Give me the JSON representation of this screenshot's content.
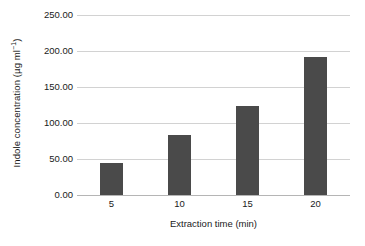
{
  "chart_data": {
    "type": "bar",
    "title": "",
    "categories": [
      "5",
      "10",
      "15",
      "20"
    ],
    "values": [
      44,
      83,
      123,
      191
    ],
    "series": [
      {
        "name": "Indole concentration",
        "values": [
          44,
          83,
          123,
          191
        ]
      }
    ],
    "xlabel": "Extraction time (min)",
    "ylabel_text": "Indole concentration (µg ml",
    "ylabel_sup": "−1",
    "ylabel_tail": ")",
    "ylabel_full": "Indole concentration (µg ml⁻¹)",
    "ylim": [
      0,
      250
    ],
    "xlim_categories": 4,
    "ytick_labels": [
      "250.00",
      "200.00",
      "150.00",
      "100.00",
      "50.00",
      "0.00"
    ],
    "ytick_values": [
      250,
      200,
      150,
      100,
      50,
      0
    ],
    "xtick_labels": [
      "5",
      "10",
      "15",
      "20"
    ],
    "grid": {
      "horizontal": true,
      "vertical": false
    },
    "legend": {
      "visible": false,
      "position": "none"
    },
    "colors": {
      "bar_fill": "#4a4a4a",
      "gridline": "#d2d2d2",
      "axis": "#b5b5b5",
      "background": "#ffffff",
      "text": "#1a1a1a"
    }
  }
}
